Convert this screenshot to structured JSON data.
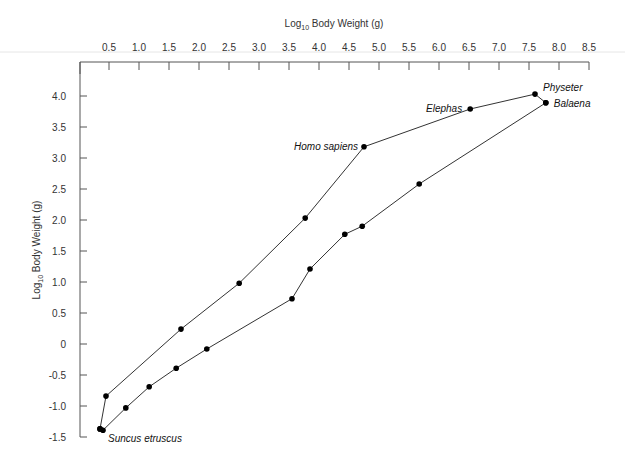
{
  "chart_data": {
    "type": "line",
    "title": "",
    "xlabel": "Log10 Body Weight (g)",
    "xlabel_main": "Log",
    "xlabel_sub": "10",
    "xlabel_rest": " Body Weight (g)",
    "ylabel": "Log10 Body Weight (g)",
    "ylabel_main": "Log",
    "ylabel_sub": "10",
    "ylabel_rest": " Body Weight (g)",
    "x_axis_position": "top",
    "xlim": [
      0.25,
      8.5
    ],
    "ylim": [
      -1.5,
      4.4
    ],
    "xticks": [
      "0.5",
      "1.0",
      "1.5",
      "2.0",
      "2.5",
      "3.0",
      "3.5",
      "4.0",
      "4.5",
      "5.0",
      "5.5",
      "6.0",
      "6.5",
      "7.0",
      "7.5",
      "8.0",
      "8.5"
    ],
    "yticks": [
      "4.0",
      "3.5",
      "3.0",
      "2.5",
      "2.0",
      "1.5",
      "1.0",
      "0.5",
      "0",
      "-0.5",
      "-1.0",
      "-1.5"
    ],
    "grid": false,
    "legend": null,
    "series": [
      {
        "name": "upper",
        "points": [
          {
            "x": 0.35,
            "y": -1.37
          },
          {
            "x": 0.45,
            "y": -0.84
          },
          {
            "x": 1.7,
            "y": 0.24
          },
          {
            "x": 2.67,
            "y": 0.98
          },
          {
            "x": 3.77,
            "y": 2.03
          },
          {
            "x": 4.75,
            "y": 3.18
          },
          {
            "x": 6.52,
            "y": 3.79
          },
          {
            "x": 7.6,
            "y": 4.03
          },
          {
            "x": 7.78,
            "y": 3.89
          }
        ]
      },
      {
        "name": "lower",
        "points": [
          {
            "x": 7.78,
            "y": 3.89
          },
          {
            "x": 5.67,
            "y": 2.58
          },
          {
            "x": 4.72,
            "y": 1.9
          },
          {
            "x": 4.43,
            "y": 1.77
          },
          {
            "x": 3.85,
            "y": 1.21
          },
          {
            "x": 3.55,
            "y": 0.73
          },
          {
            "x": 2.13,
            "y": -0.08
          },
          {
            "x": 1.62,
            "y": -0.39
          },
          {
            "x": 1.17,
            "y": -0.69
          },
          {
            "x": 0.78,
            "y": -1.03
          },
          {
            "x": 0.4,
            "y": -1.39
          },
          {
            "x": 0.35,
            "y": -1.37
          }
        ]
      }
    ],
    "annotations": [
      {
        "text": "Physeter",
        "x": 7.6,
        "y": 4.03,
        "anchor": "start",
        "dx": 8,
        "dy": -3
      },
      {
        "text": "Balaena",
        "x": 7.78,
        "y": 3.89,
        "anchor": "start",
        "dx": 8,
        "dy": 4
      },
      {
        "text": "Elephas",
        "x": 6.52,
        "y": 3.79,
        "anchor": "end",
        "dx": -8,
        "dy": 3
      },
      {
        "text": "Homo sapiens",
        "x": 4.75,
        "y": 3.18,
        "anchor": "end",
        "dx": -6,
        "dy": 3
      },
      {
        "text": "Suncus etruscus",
        "x": 0.4,
        "y": -1.39,
        "anchor": "start",
        "dx": 5,
        "dy": 12
      }
    ]
  }
}
